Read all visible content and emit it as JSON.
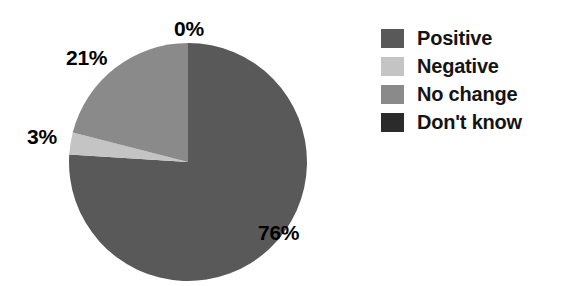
{
  "chart_data": {
    "type": "pie",
    "title": "",
    "labels": [
      "Positive",
      "Negative",
      "No change",
      "Don't know"
    ],
    "values": [
      76,
      3,
      21,
      0
    ],
    "value_labels": [
      "76%",
      "3%",
      "21%",
      "0%"
    ],
    "units": "percent",
    "colors": [
      "#595959",
      "#c4c4c4",
      "#8a8a8a",
      "#2b2b2b"
    ],
    "start_angle_deg": 0,
    "direction": "clockwise",
    "legend_position": "right",
    "grid": false,
    "background": "#ffffff"
  },
  "pie": {
    "slices": [
      {
        "name": "Positive",
        "value": 76,
        "label": "76%",
        "color": "#595959"
      },
      {
        "name": "Negative",
        "value": 3,
        "label": "3%",
        "color": "#c4c4c4"
      },
      {
        "name": "No change",
        "value": 21,
        "label": "21%",
        "color": "#8a8a8a"
      },
      {
        "name": "Don't know",
        "value": 0,
        "label": "0%",
        "color": "#2b2b2b"
      }
    ],
    "callouts": {
      "top": "0%",
      "upper_left": "21%",
      "left": "3%",
      "lower_right": "76%"
    }
  },
  "legend": {
    "items": [
      {
        "label": "Positive",
        "color": "#595959"
      },
      {
        "label": "Negative",
        "color": "#c4c4c4"
      },
      {
        "label": "No change",
        "color": "#8a8a8a"
      },
      {
        "label": "Don't know",
        "color": "#2b2b2b"
      }
    ]
  }
}
